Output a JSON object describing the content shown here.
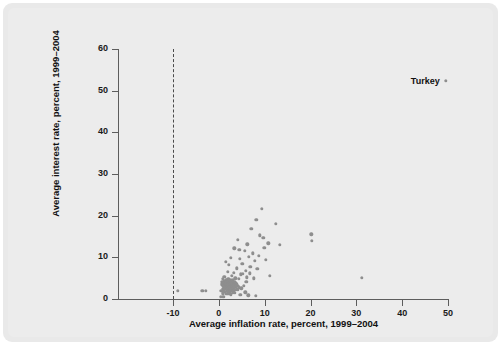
{
  "chart_data": {
    "type": "scatter",
    "title": "",
    "xlabel": "Average inflation rate, percent, 1999–2004",
    "ylabel": "Average interest rate, percent, 1999–2004",
    "xlim": [
      -10,
      50
    ],
    "ylim": [
      0,
      60
    ],
    "xticks": [
      -10,
      0,
      10,
      20,
      30,
      40,
      50
    ],
    "yticks": [
      0,
      10,
      20,
      30,
      40,
      50,
      60
    ],
    "xtick_labels": [
      "-10",
      "0",
      "10",
      "20",
      "30",
      "40",
      "50"
    ],
    "ytick_labels": [
      "0",
      "10",
      "20",
      "30",
      "40",
      "50",
      "60"
    ],
    "grid": false,
    "legend": null,
    "reference_lines": [
      {
        "name": "zero-inflation-line",
        "orientation": "vertical",
        "x": 0,
        "style": "dashed"
      }
    ],
    "annotations": [
      {
        "label": "Turkey",
        "x": 49.5,
        "y": 52.3
      }
    ],
    "marker_color": "#8e8e8e",
    "points": [
      {
        "x": 49.5,
        "y": 52.3
      },
      {
        "x": -9.0,
        "y": 1.9
      },
      {
        "x": -3.6,
        "y": 1.9
      },
      {
        "x": -2.9,
        "y": 1.9
      },
      {
        "x": 20.2,
        "y": 15.5
      },
      {
        "x": 20.3,
        "y": 13.9
      },
      {
        "x": 31.2,
        "y": 5.1
      },
      {
        "x": 9.4,
        "y": 21.6
      },
      {
        "x": 8.2,
        "y": 19.0
      },
      {
        "x": 12.4,
        "y": 18.0
      },
      {
        "x": 7.1,
        "y": 16.8
      },
      {
        "x": 8.9,
        "y": 15.3
      },
      {
        "x": 9.7,
        "y": 14.7
      },
      {
        "x": 4.1,
        "y": 14.2
      },
      {
        "x": 13.3,
        "y": 13.0
      },
      {
        "x": 6.2,
        "y": 13.1
      },
      {
        "x": 3.4,
        "y": 12.2
      },
      {
        "x": 9.9,
        "y": 12.3
      },
      {
        "x": 5.6,
        "y": 11.6
      },
      {
        "x": 7.4,
        "y": 11.0
      },
      {
        "x": 8.7,
        "y": 10.4
      },
      {
        "x": 6.5,
        "y": 10.2
      },
      {
        "x": 2.6,
        "y": 9.9
      },
      {
        "x": 4.6,
        "y": 9.6
      },
      {
        "x": 7.9,
        "y": 9.2
      },
      {
        "x": 1.5,
        "y": 8.9
      },
      {
        "x": 5.1,
        "y": 8.5
      },
      {
        "x": 2.2,
        "y": 8.2
      },
      {
        "x": 6.9,
        "y": 7.8
      },
      {
        "x": 3.9,
        "y": 7.4
      },
      {
        "x": 8.4,
        "y": 7.2
      },
      {
        "x": 5.9,
        "y": 6.8
      },
      {
        "x": 1.9,
        "y": 6.6
      },
      {
        "x": 3.2,
        "y": 6.3
      },
      {
        "x": 4.8,
        "y": 5.9
      },
      {
        "x": 2.8,
        "y": 5.6
      },
      {
        "x": 6.1,
        "y": 5.2
      },
      {
        "x": 1.2,
        "y": 5.4
      },
      {
        "x": 3.6,
        "y": 5.0
      },
      {
        "x": 0.9,
        "y": 4.9
      },
      {
        "x": 2.1,
        "y": 4.8
      },
      {
        "x": 1.6,
        "y": 4.6
      },
      {
        "x": 2.6,
        "y": 4.6
      },
      {
        "x": 3.1,
        "y": 4.5
      },
      {
        "x": 1.1,
        "y": 4.4
      },
      {
        "x": 2.3,
        "y": 4.3
      },
      {
        "x": 1.8,
        "y": 4.2
      },
      {
        "x": 2.9,
        "y": 4.2
      },
      {
        "x": 3.4,
        "y": 4.1
      },
      {
        "x": 0.7,
        "y": 4.1
      },
      {
        "x": 1.4,
        "y": 4.0
      },
      {
        "x": 2.0,
        "y": 4.0
      },
      {
        "x": 2.5,
        "y": 3.9
      },
      {
        "x": 3.0,
        "y": 3.9
      },
      {
        "x": 3.6,
        "y": 3.8
      },
      {
        "x": 1.0,
        "y": 3.8
      },
      {
        "x": 1.6,
        "y": 3.7
      },
      {
        "x": 2.2,
        "y": 3.7
      },
      {
        "x": 2.7,
        "y": 3.6
      },
      {
        "x": 3.2,
        "y": 3.6
      },
      {
        "x": 3.8,
        "y": 3.5
      },
      {
        "x": 0.6,
        "y": 3.5
      },
      {
        "x": 1.3,
        "y": 3.4
      },
      {
        "x": 1.9,
        "y": 3.4
      },
      {
        "x": 2.4,
        "y": 3.3
      },
      {
        "x": 2.9,
        "y": 3.3
      },
      {
        "x": 3.4,
        "y": 3.2
      },
      {
        "x": 4.0,
        "y": 3.2
      },
      {
        "x": 0.9,
        "y": 3.1
      },
      {
        "x": 1.5,
        "y": 3.1
      },
      {
        "x": 2.1,
        "y": 3.0
      },
      {
        "x": 2.6,
        "y": 3.0
      },
      {
        "x": 3.1,
        "y": 2.9
      },
      {
        "x": 3.7,
        "y": 2.9
      },
      {
        "x": 4.3,
        "y": 2.8
      },
      {
        "x": 1.2,
        "y": 2.8
      },
      {
        "x": 1.8,
        "y": 2.7
      },
      {
        "x": 2.3,
        "y": 2.7
      },
      {
        "x": 2.8,
        "y": 2.6
      },
      {
        "x": 3.3,
        "y": 2.6
      },
      {
        "x": 3.9,
        "y": 2.5
      },
      {
        "x": 0.8,
        "y": 2.5
      },
      {
        "x": 1.4,
        "y": 2.4
      },
      {
        "x": 2.0,
        "y": 2.4
      },
      {
        "x": 2.5,
        "y": 2.3
      },
      {
        "x": 3.0,
        "y": 2.3
      },
      {
        "x": 3.6,
        "y": 2.2
      },
      {
        "x": 4.2,
        "y": 2.2
      },
      {
        "x": 1.1,
        "y": 2.1
      },
      {
        "x": 1.7,
        "y": 2.1
      },
      {
        "x": 2.2,
        "y": 2.0
      },
      {
        "x": 2.7,
        "y": 2.0
      },
      {
        "x": 3.2,
        "y": 1.9
      },
      {
        "x": 0.5,
        "y": 1.9
      },
      {
        "x": 1.3,
        "y": 1.8
      },
      {
        "x": 1.9,
        "y": 1.7
      },
      {
        "x": 2.4,
        "y": 1.7
      },
      {
        "x": 3.0,
        "y": 1.6
      },
      {
        "x": 3.5,
        "y": 1.5
      },
      {
        "x": 0.9,
        "y": 1.4
      },
      {
        "x": 1.6,
        "y": 1.3
      },
      {
        "x": 2.1,
        "y": 1.2
      },
      {
        "x": 2.6,
        "y": 1.1
      },
      {
        "x": 4.9,
        "y": 2.6
      },
      {
        "x": 5.4,
        "y": 3.1
      },
      {
        "x": 4.4,
        "y": 4.9
      },
      {
        "x": 5.2,
        "y": 6.1
      },
      {
        "x": 6.7,
        "y": 6.2
      },
      {
        "x": 4.7,
        "y": 1.0
      },
      {
        "x": 5.8,
        "y": 1.6
      },
      {
        "x": 6.4,
        "y": 0.9
      },
      {
        "x": 0.4,
        "y": 0.6
      },
      {
        "x": 1.0,
        "y": 0.5
      },
      {
        "x": 8.0,
        "y": 0.8
      },
      {
        "x": 10.3,
        "y": 9.4
      },
      {
        "x": 11.1,
        "y": 5.5
      },
      {
        "x": 7.6,
        "y": 5.0
      },
      {
        "x": 6.0,
        "y": 4.2
      },
      {
        "x": 4.5,
        "y": 11.8
      },
      {
        "x": 10.8,
        "y": 13.4
      }
    ]
  }
}
